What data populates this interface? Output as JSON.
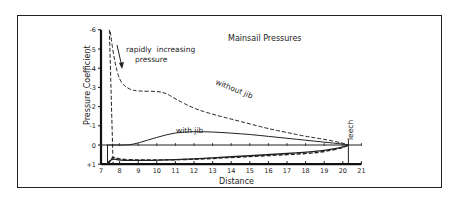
{
  "chart_data": {
    "type": "line",
    "title": "Mainsail Pressures",
    "xlabel": "Distance",
    "ylabel": "Pressure Coefficient",
    "xlim": [
      7,
      21
    ],
    "ylim": [
      1,
      -6
    ],
    "x_ticks": [
      "7",
      "8",
      "9",
      "10",
      "11",
      "12",
      "13",
      "14",
      "15",
      "16",
      "17",
      "18",
      "19",
      "20",
      "21"
    ],
    "y_ticks": [
      "-6",
      "-5",
      "-4",
      "-3",
      "-2",
      "-1",
      "0",
      "+1"
    ],
    "series": [
      {
        "name": "without jib",
        "style": "dashed",
        "x": [
          7.5,
          7.7,
          8.0,
          8.5,
          9.0,
          10.0,
          10.5,
          11.0,
          12.0,
          13.0,
          14.0,
          15.0,
          16.0,
          17.0,
          18.0,
          19.0,
          20.0,
          20.3
        ],
        "values": [
          -5.9,
          -4.5,
          -3.3,
          -2.9,
          -2.8,
          -2.8,
          -2.7,
          -2.4,
          -1.9,
          -1.6,
          -1.35,
          -1.1,
          -0.85,
          -0.65,
          -0.45,
          -0.3,
          -0.1,
          0.0
        ]
      },
      {
        "name": "with jib",
        "style": "solid",
        "x": [
          7.3,
          8.0,
          8.5,
          9.0,
          10.0,
          11.0,
          12.0,
          13.0,
          14.0,
          15.0,
          16.0,
          17.0,
          18.0,
          19.0,
          20.0,
          20.3
        ],
        "values": [
          0.0,
          0.0,
          0.0,
          -0.1,
          -0.4,
          -0.65,
          -0.7,
          -0.68,
          -0.62,
          -0.55,
          -0.45,
          -0.35,
          -0.25,
          -0.15,
          -0.05,
          0.0
        ]
      },
      {
        "name": "windward without jib",
        "style": "dashed",
        "x": [
          7.4,
          7.6,
          8.0,
          9.0,
          10.0,
          12.0,
          14.0,
          16.0,
          18.0,
          19.0,
          20.0,
          20.3
        ],
        "values": [
          1.0,
          0.6,
          0.75,
          0.78,
          0.78,
          0.75,
          0.65,
          0.55,
          0.45,
          0.35,
          0.15,
          0.0
        ]
      },
      {
        "name": "windward with jib",
        "style": "solid",
        "x": [
          7.3,
          7.6,
          8.0,
          9.0,
          10.0,
          12.0,
          14.0,
          16.0,
          18.0,
          19.0,
          20.0,
          20.3
        ],
        "values": [
          1.0,
          0.7,
          0.8,
          0.8,
          0.8,
          0.72,
          0.62,
          0.5,
          0.38,
          0.28,
          0.12,
          0.0
        ]
      }
    ],
    "annotations": [
      {
        "text": "rapidly increasing pressure",
        "x": 9.5,
        "y": -4.8,
        "arrow_to": [
          8.1,
          -3.6
        ]
      },
      {
        "text": "without jib",
        "x": 12.6,
        "y": -2.1,
        "rotation": 20
      },
      {
        "text": "with jib",
        "x": 11.0,
        "y": -0.85
      },
      {
        "text": "leech",
        "x": 20.3,
        "y": -0.2,
        "rotation": -90
      }
    ],
    "grid": false,
    "legend": "inline labels"
  }
}
